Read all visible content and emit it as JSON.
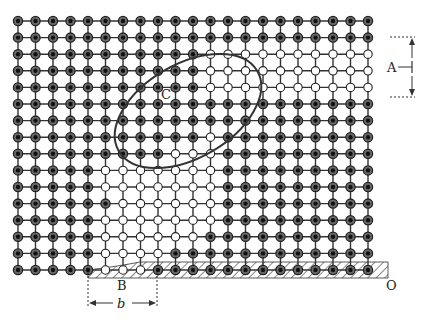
{
  "figure": {
    "colors": {
      "background": "#ffffff",
      "ink": "#222222",
      "atom_fill_dark": "#3a3a3a",
      "atom_fill_open": "#ffffff",
      "hatch": "#555555"
    },
    "lattice": {
      "columns": 21,
      "rows": 16,
      "origin_x": 18,
      "origin_y": 21,
      "spacing_x": 17.5,
      "spacing_y": 16.6
    },
    "labels": {
      "A": "A",
      "B": "B",
      "C": "C",
      "O": "O",
      "b_symbol": "b"
    },
    "annotations": {
      "A_dimension": "Edge-dislocation region spacing marker at right",
      "B_dimension": "Burgers vector b width marker at bottom",
      "C_loop": "Elliptical region enclosing distorted atoms",
      "O_corner": "Corner of the slip plane"
    }
  }
}
